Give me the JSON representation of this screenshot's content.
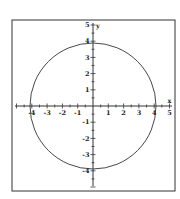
{
  "chart_data": {
    "type": "line",
    "title": "",
    "xlabel": "x",
    "ylabel": "y",
    "xlim": [
      -4.5,
      5
    ],
    "ylim": [
      -5.3,
      5
    ],
    "grid": false,
    "legend": null,
    "x_tick_labels": [
      "-4",
      "-3",
      "-2",
      "-1",
      "1",
      "2",
      "3",
      "4",
      "5"
    ],
    "y_tick_labels": [
      "5",
      "4",
      "3",
      "2",
      "1",
      "-1",
      "-2",
      "-3",
      "-4"
    ],
    "series": [
      {
        "name": "circle x^2 + y^2 = 16",
        "shape": "circle",
        "center": [
          0,
          0
        ],
        "radius": 4,
        "points": [
          [
            4,
            0
          ],
          [
            0,
            4
          ],
          [
            -4,
            0
          ],
          [
            0,
            -4
          ]
        ]
      }
    ]
  },
  "axes": {
    "x_label": "x",
    "y_label": "y"
  },
  "colors": {
    "line": "#333333",
    "frame": "#333333",
    "background": "#ffffff"
  }
}
